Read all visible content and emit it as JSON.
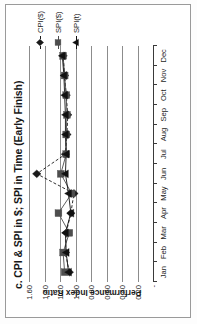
{
  "chart_data": {
    "type": "line",
    "title": "c. CPI & SPI in $; SPI in Time (Early Finish)",
    "xlabel": "",
    "ylabel": "Performance Index Ratio",
    "categories": [
      "Jan",
      "Feb",
      "Mar",
      "Apr",
      "May",
      "Jun",
      "Jul",
      "Aug",
      "Sep",
      "Oct",
      "Nov",
      "Dec"
    ],
    "x": [
      "Jan",
      "Feb",
      "Mar",
      "Apr",
      "May",
      "Jun",
      "Jul",
      "Aug",
      "Sep",
      "Oct",
      "Nov",
      "Dec"
    ],
    "ylim": [
      0,
      1.6
    ],
    "ytick_labels": [
      "1.60",
      "1.40",
      "1.20",
      "1.00",
      "0.80",
      "0.60",
      "0.40",
      "0.20",
      "-"
    ],
    "ytick_values": [
      1.6,
      1.4,
      1.2,
      1.0,
      0.8,
      0.6,
      0.4,
      0.2,
      0.0
    ],
    "grid": "horizontal",
    "legend_position": "right",
    "series": [
      {
        "name": "CPI($)",
        "marker": "diamond",
        "line_style": "dashed",
        "color": "#1a1a1a",
        "values": [
          1.08,
          1.13,
          1.12,
          1.06,
          1.02,
          1.5,
          1.13,
          1.11,
          1.1,
          1.12,
          1.14,
          1.16
        ]
      },
      {
        "name": "SPI($)",
        "marker": "square",
        "line_style": "solid",
        "color": "#4d4d4d",
        "values": [
          1.14,
          1.16,
          1.08,
          1.22,
          1.05,
          1.19,
          1.12,
          1.12,
          1.11,
          1.12,
          1.14,
          1.16
        ]
      },
      {
        "name": "SPI(t)",
        "marker": "triangle",
        "line_style": "solid",
        "color": "#111111",
        "values": [
          1.09,
          1.12,
          1.13,
          1.06,
          1.09,
          1.13,
          1.12,
          1.13,
          1.13,
          1.14,
          1.15,
          1.17
        ]
      }
    ]
  },
  "legend": {
    "items": [
      {
        "label": "CPI($)"
      },
      {
        "label": "SPI($)"
      },
      {
        "label": "SPI(t)"
      }
    ]
  },
  "colors": {
    "grid": "#8c8c8c",
    "axis": "#3a3a3a",
    "text": "#1d1d1d",
    "background": "#ffffff"
  }
}
